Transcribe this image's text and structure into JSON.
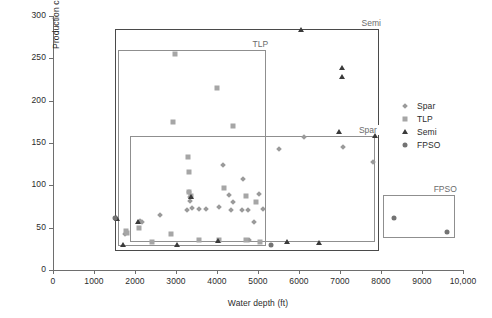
{
  "chart_data": {
    "type": "scatter",
    "title": "",
    "xlabel": "Water depth (ft)",
    "ylabel": "Production capacity (Mboepd)",
    "xlim": [
      0,
      10000
    ],
    "ylim": [
      0,
      300
    ],
    "xticks": [
      0,
      1000,
      2000,
      3000,
      4000,
      5000,
      6000,
      7000,
      8000,
      9000,
      10000
    ],
    "xtick_labels": [
      "0",
      "1000",
      "2000",
      "3000",
      "4000",
      "5000",
      "6000",
      "7000",
      "8000",
      "9000",
      "10,000"
    ],
    "yticks": [
      0,
      50,
      100,
      150,
      200,
      250,
      300
    ],
    "ytick_labels": [
      "0",
      "50",
      "100",
      "150",
      "200",
      "250",
      "300"
    ],
    "grid": false,
    "legend_position": "right",
    "legend": [
      {
        "name": "Spar",
        "marker": "diamond",
        "color": "#9a9a9a"
      },
      {
        "name": "TLP",
        "marker": "square",
        "color": "#a6a6a6"
      },
      {
        "name": "Semi",
        "marker": "triangle",
        "color": "#3a3a3a"
      },
      {
        "name": "FPSO",
        "marker": "circle",
        "color": "#737373"
      }
    ],
    "annotation_boxes": [
      {
        "label": "Semi",
        "x0": 1500,
        "x1": 7950,
        "y0": 22,
        "y1": 285,
        "label_anchor": "top-right"
      },
      {
        "label": "TLP",
        "x0": 1580,
        "x1": 5200,
        "y0": 28,
        "y1": 260,
        "label_anchor": "top-right"
      },
      {
        "label": "Spar",
        "x0": 1880,
        "x1": 7850,
        "y0": 33,
        "y1": 158,
        "label_anchor": "top-right"
      },
      {
        "label": "FPSO",
        "x0": 8050,
        "x1": 9800,
        "y0": 38,
        "y1": 88,
        "label_anchor": "top-right"
      }
    ],
    "series": [
      {
        "name": "Spar",
        "marker": "diamond",
        "color": "#9a9a9a",
        "points": [
          [
            1760,
            43
          ],
          [
            2170,
            57
          ],
          [
            2120,
            58
          ],
          [
            2620,
            65
          ],
          [
            3310,
            92
          ],
          [
            3330,
            86
          ],
          [
            3350,
            81
          ],
          [
            3400,
            73
          ],
          [
            3560,
            72
          ],
          [
            3720,
            72
          ],
          [
            3260,
            71
          ],
          [
            4060,
            74
          ],
          [
            4300,
            88
          ],
          [
            4400,
            80
          ],
          [
            4350,
            71
          ],
          [
            4600,
            71
          ],
          [
            4760,
            71
          ],
          [
            4630,
            108
          ],
          [
            4150,
            124
          ],
          [
            5020,
            90
          ],
          [
            5130,
            72
          ],
          [
            5500,
            143
          ],
          [
            6130,
            157
          ],
          [
            7080,
            145
          ],
          [
            7800,
            127
          ],
          [
            4900,
            57
          ],
          [
            4780,
            36
          ]
        ]
      },
      {
        "name": "TLP",
        "marker": "square",
        "color": "#a6a6a6",
        "points": [
          [
            2980,
            255
          ],
          [
            4000,
            215
          ],
          [
            2930,
            175
          ],
          [
            4400,
            170
          ],
          [
            3300,
            134
          ],
          [
            3310,
            116
          ],
          [
            3320,
            92
          ],
          [
            3360,
            87
          ],
          [
            4170,
            97
          ],
          [
            4700,
            87
          ],
          [
            4950,
            80
          ],
          [
            2100,
            50
          ],
          [
            1790,
            46
          ],
          [
            1810,
            44
          ],
          [
            2870,
            42
          ],
          [
            3550,
            36
          ],
          [
            4060,
            36
          ],
          [
            4710,
            35
          ],
          [
            2410,
            33
          ],
          [
            5060,
            33
          ]
        ]
      },
      {
        "name": "Semi",
        "marker": "triangle",
        "color": "#3a3a3a",
        "points": [
          [
            6050,
            283
          ],
          [
            7050,
            238
          ],
          [
            7060,
            228
          ],
          [
            6970,
            163
          ],
          [
            7860,
            158
          ],
          [
            3360,
            86
          ],
          [
            2070,
            57
          ],
          [
            1530,
            62
          ],
          [
            1560,
            60
          ],
          [
            3030,
            30
          ],
          [
            4020,
            34
          ],
          [
            5700,
            33
          ],
          [
            6480,
            32
          ],
          [
            1700,
            30
          ]
        ]
      },
      {
        "name": "FPSO",
        "marker": "circle",
        "color": "#737373",
        "points": [
          [
            1520,
            62
          ],
          [
            5310,
            30
          ],
          [
            8320,
            62
          ],
          [
            9600,
            45
          ]
        ]
      }
    ]
  },
  "caption": ""
}
